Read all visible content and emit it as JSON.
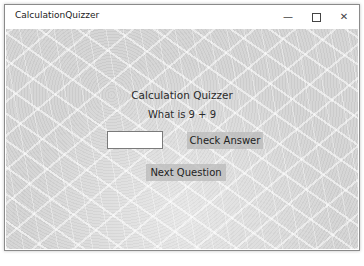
{
  "window": {
    "title": "CalculationQuizzer",
    "controls": {
      "minimize": "—",
      "maximize": "",
      "close": "✕"
    }
  },
  "main": {
    "heading": "Calculation Quizzer",
    "question": "What is 9 + 9",
    "answer_value": "",
    "check_label": "Check Answer",
    "next_label": "Next Question"
  }
}
